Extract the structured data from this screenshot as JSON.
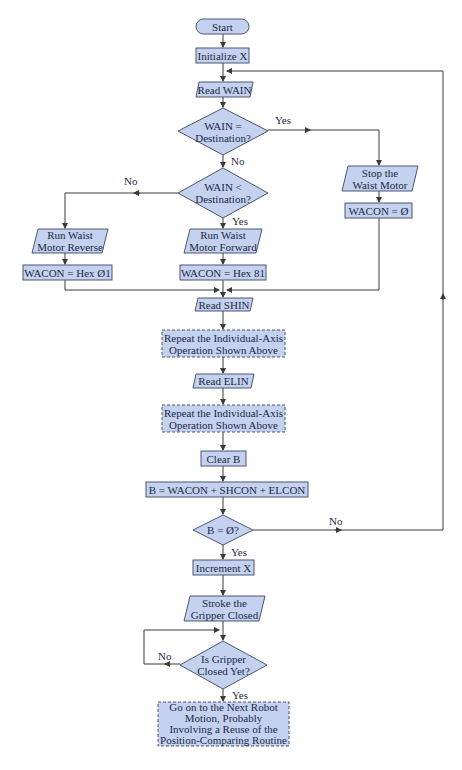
{
  "colors": {
    "fill": "#c4d1ef",
    "stroke": "#4a5670",
    "line": "#3a3a3a",
    "text": "#1d2a44",
    "background": "#ffffff"
  },
  "nodes": {
    "start": {
      "shape": "terminal",
      "text": "Start"
    },
    "init_x": {
      "shape": "process",
      "text": "Initialize X"
    },
    "read_wain": {
      "shape": "io",
      "text": "Read WAIN"
    },
    "wain_eq": {
      "shape": "decision",
      "text": "WAIN =\nDestination?"
    },
    "wain_lt": {
      "shape": "decision",
      "text": "WAIN <\nDestination?"
    },
    "stop_waist": {
      "shape": "io",
      "text": "Stop the\nWaist Motor"
    },
    "wacon_zero": {
      "shape": "process",
      "text": "WACON = Ø"
    },
    "run_reverse": {
      "shape": "io",
      "text": "Run Waist\nMotor Reverse"
    },
    "wacon_01": {
      "shape": "process",
      "text": "WACON = Hex Ø1"
    },
    "run_forward": {
      "shape": "io",
      "text": "Run Waist\nMotor Forward"
    },
    "wacon_81": {
      "shape": "process",
      "text": "WACON = Hex 81"
    },
    "read_shin": {
      "shape": "io",
      "text": "Read SHIN"
    },
    "repeat_1": {
      "shape": "predefined-dashed",
      "text": "Repeat the Individual-Axis\nOperation Shown Above"
    },
    "read_elin": {
      "shape": "io",
      "text": "Read ELIN"
    },
    "repeat_2": {
      "shape": "predefined-dashed",
      "text": "Repeat the Individual-Axis\nOperation Shown Above"
    },
    "clear_b": {
      "shape": "process",
      "text": "Clear B"
    },
    "b_sum": {
      "shape": "process",
      "text": "B = WACON + SHCON + ELCON"
    },
    "b_zero": {
      "shape": "decision",
      "text": "B = Ø?"
    },
    "inc_x": {
      "shape": "process",
      "text": "Increment X"
    },
    "stroke_gripper": {
      "shape": "io",
      "text": "Stroke the\nGripper Closed"
    },
    "gripper_closed": {
      "shape": "decision",
      "text": "Is Gripper\nClosed Yet?"
    },
    "next_motion": {
      "shape": "predefined-dashed",
      "text": "Go on to the Next Robot\nMotion, Probably\nInvolving a Reuse of the\nPosition-Comparing Routine"
    }
  },
  "labels": {
    "wain_eq_yes": "Yes",
    "wain_eq_no": "No",
    "wain_lt_no": "No",
    "wain_lt_yes": "Yes",
    "b_zero_no": "No",
    "b_zero_yes": "Yes",
    "gripper_no": "No",
    "gripper_yes": "Yes"
  }
}
